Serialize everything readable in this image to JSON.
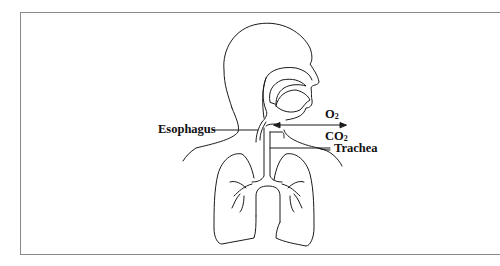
{
  "diagram": {
    "labels": {
      "esophagus": "Esophagus",
      "trachea": "Trachea",
      "oxygen": {
        "base": "O",
        "sub": "2"
      },
      "carbon_dioxide": {
        "base": "CO",
        "sub": "2"
      }
    },
    "arrow": {
      "direction": "bidirectional",
      "meaning": "gas exchange O2 in / CO2 out"
    },
    "colors": {
      "stroke": "#1a1a1a",
      "frame": "#8a8a8a",
      "background": "#ffffff"
    }
  }
}
